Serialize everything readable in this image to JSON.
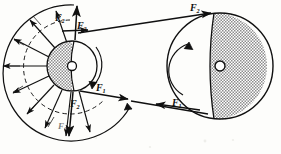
{
  "figure": {
    "background_color": "#fdfdfb",
    "ink_color": "#101010",
    "hatch_color": "#8d8d8d"
  },
  "labels": {
    "left_pulley_f2_upper_left": {
      "base": "F",
      "sub": "2",
      "x": 55,
      "y": 14
    },
    "left_pulley_f2_upper_right": {
      "base": "F",
      "sub": "2",
      "x": 76,
      "y": 22
    },
    "left_pulley_f1_lower": {
      "base": "F",
      "sub": "1",
      "x": 96,
      "y": 84
    },
    "left_pulley_f2_lower": {
      "base": "F",
      "sub": "2",
      "x": 69,
      "y": 99
    },
    "left_pulley_f1_bottom": {
      "base": "F",
      "sub": "1",
      "x": 58,
      "y": 123
    },
    "right_pulley_f2_top": {
      "base": "F",
      "sub": "2",
      "x": 190,
      "y": 4
    },
    "right_pulley_f1_bottom": {
      "base": "F",
      "sub": "1",
      "x": 172,
      "y": 99
    }
  },
  "left_pulley": {
    "name": "small-pulley",
    "center_x": 72,
    "center_y": 66,
    "hub_radius": 25,
    "hub_shaft_radius": 4.5,
    "fan_outer_radius": 72,
    "fan_dashed_radius": 50,
    "rotation_direction": "clockwise",
    "spoke_count": 11,
    "shaded_side": "left"
  },
  "right_pulley": {
    "name": "large-pulley",
    "center_x": 220,
    "center_y": 66,
    "radius": 53,
    "hub_shaft_radius": 5,
    "rotation_direction": "counterclockwise",
    "shaded_side": "right"
  },
  "belt": {
    "upper_span_label": "F2",
    "lower_span_label": "F1",
    "upper_from_x": 78,
    "upper_from_y": 33,
    "upper_to_x": 211,
    "upper_to_y": 13,
    "lower_from_x": 80,
    "lower_from_y": 91,
    "lower_to_x": 208,
    "lower_to_y": 114
  }
}
